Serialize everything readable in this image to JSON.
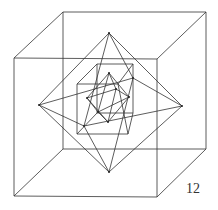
{
  "figure": {
    "label": "12",
    "stroke_color": "#333333",
    "outer_cube": {
      "front": [
        [
          14,
          58
        ],
        [
          157,
          59
        ],
        [
          157,
          197
        ],
        [
          14,
          196
        ]
      ],
      "back": [
        [
          63,
          12
        ],
        [
          206,
          12
        ],
        [
          206,
          149
        ],
        [
          63,
          149
        ]
      ]
    },
    "outer_octahedron": {
      "top": [
        109,
        33
      ],
      "bottom": [
        109,
        172
      ],
      "left": [
        39,
        105
      ],
      "right": [
        182,
        106
      ],
      "front": [
        84,
        126
      ],
      "back": [
        133,
        78
      ]
    },
    "inner_cube": {
      "front": [
        [
          77,
          84
        ],
        [
          118,
          84
        ],
        [
          128,
          134
        ],
        [
          77,
          134
        ]
      ],
      "back": [
        [
          97,
          64
        ],
        [
          133,
          64
        ],
        [
          133,
          113
        ],
        [
          97,
          113
        ]
      ]
    },
    "inner_octahedron": {
      "top": [
        109,
        73
      ],
      "bottom": [
        108,
        122
      ],
      "left": [
        87,
        98
      ],
      "right": [
        129,
        97
      ],
      "front": [
        98,
        112
      ],
      "back": [
        116,
        89
      ]
    }
  }
}
